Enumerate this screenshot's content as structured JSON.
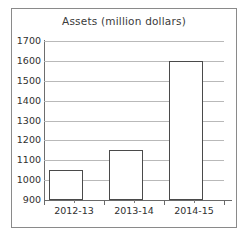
{
  "chart_data": {
    "type": "bar",
    "title": "Assets (million dollars)",
    "xlabel": "",
    "ylabel": "",
    "categories": [
      "2012-13",
      "2013-14",
      "2014-15"
    ],
    "values": [
      1050,
      1150,
      1600
    ],
    "ylim": [
      900,
      1700
    ],
    "ytick_step": 100,
    "yticks": [
      900,
      1000,
      1100,
      1200,
      1300,
      1400,
      1500,
      1600,
      1700
    ],
    "ytick_labels": [
      "900",
      "1000",
      "1100",
      "1200",
      "1300",
      "1400",
      "1500",
      "1600",
      "1700"
    ],
    "grid": true,
    "grid_axis": "y",
    "legend": false,
    "legend_position": "none",
    "series": [
      {
        "name": "Assets",
        "values": [
          1050,
          1150,
          1600
        ]
      }
    ],
    "colors": {
      "bar_fill": "#ffffff",
      "bar_edge": "#4a4a4a",
      "gridline": "#b9b9b9",
      "axis": "#6a6a6a",
      "frame": "#8a8a8a",
      "text": "#2f2f2f",
      "title_text": "#3b3b3b",
      "background": "#ffffff"
    }
  }
}
